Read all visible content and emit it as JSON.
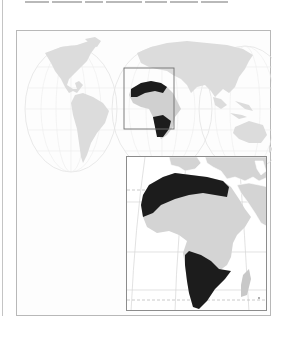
{
  "caption": {
    "text": "",
    "note_visible": "clipped text line at top edge, illegible"
  },
  "figure": {
    "world_map": {
      "projection": "interrupted globe (two hemispheres + partial third)",
      "land_color": "#d9d9d9",
      "grid_color": "#e6e6e6",
      "highlight_color": "#1c1c1c",
      "highlighted_regions": [
        "North Africa",
        "Southern Africa"
      ],
      "locator_box_color": "#707070"
    },
    "inset_map": {
      "subject": "Africa",
      "land_color": "#d4d4d4",
      "highlight_color": "#1c1c1c",
      "highlighted_regions": [
        "North Africa (Sahara band)",
        "Southern Africa"
      ],
      "border_color": "#8c8c8c"
    }
  }
}
